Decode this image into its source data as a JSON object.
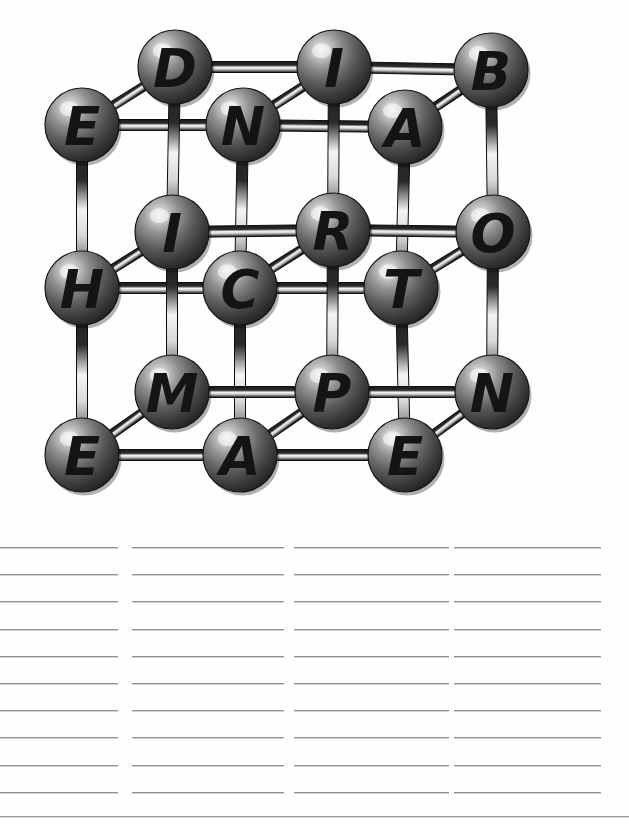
{
  "page": {
    "background_color": "#ffffff",
    "width": 629,
    "height": 824
  },
  "diagram": {
    "type": "3d-cubic-lattice-ball-and-stick",
    "sphere_color": "#6a6a6a",
    "sphere_dark_color": "#2a2a2a",
    "sphere_highlight_color": "#e8e8e8",
    "letter_color": "#141414",
    "bond_color": "#1b1b1b",
    "bond_highlight_color": "#f2f2f2",
    "grid": {
      "columns": 3,
      "rows": 3,
      "layers": 2
    },
    "letters_reading_order": [
      "E",
      "D",
      "N",
      "I",
      "A",
      "B",
      "H",
      "I",
      "C",
      "R",
      "T",
      "O",
      "E",
      "M",
      "A",
      "P",
      "E",
      "N"
    ],
    "nodes": [
      {
        "id": "n-e-1",
        "label": "E",
        "cx": 82,
        "cy": 125,
        "r": 37,
        "layer": "front",
        "row": 0,
        "col": 0
      },
      {
        "id": "n-d",
        "label": "D",
        "cx": 175,
        "cy": 67,
        "r": 37,
        "layer": "back",
        "row": 0,
        "col": 0
      },
      {
        "id": "n-n-1",
        "label": "N",
        "cx": 243,
        "cy": 125,
        "r": 37,
        "layer": "front",
        "row": 0,
        "col": 1
      },
      {
        "id": "n-i-1",
        "label": "I",
        "cx": 334,
        "cy": 67,
        "r": 37,
        "layer": "back",
        "row": 0,
        "col": 1
      },
      {
        "id": "n-a-1",
        "label": "A",
        "cx": 405,
        "cy": 127,
        "r": 37,
        "layer": "front",
        "row": 0,
        "col": 2
      },
      {
        "id": "n-b",
        "label": "B",
        "cx": 491,
        "cy": 70,
        "r": 37,
        "layer": "back",
        "row": 0,
        "col": 2
      },
      {
        "id": "n-h",
        "label": "H",
        "cx": 82,
        "cy": 288,
        "r": 37,
        "layer": "front",
        "row": 1,
        "col": 0
      },
      {
        "id": "n-i-2",
        "label": "I",
        "cx": 172,
        "cy": 232,
        "r": 37,
        "layer": "back",
        "row": 1,
        "col": 0
      },
      {
        "id": "n-c",
        "label": "C",
        "cx": 240,
        "cy": 288,
        "r": 37,
        "layer": "front",
        "row": 1,
        "col": 1
      },
      {
        "id": "n-r",
        "label": "R",
        "cx": 333,
        "cy": 230,
        "r": 37,
        "layer": "back",
        "row": 1,
        "col": 1
      },
      {
        "id": "n-t",
        "label": "T",
        "cx": 401,
        "cy": 288,
        "r": 37,
        "layer": "front",
        "row": 1,
        "col": 2
      },
      {
        "id": "n-o",
        "label": "O",
        "cx": 493,
        "cy": 232,
        "r": 37,
        "layer": "back",
        "row": 1,
        "col": 2
      },
      {
        "id": "n-e-2",
        "label": "E",
        "cx": 82,
        "cy": 455,
        "r": 37,
        "layer": "front",
        "row": 2,
        "col": 0
      },
      {
        "id": "n-m",
        "label": "M",
        "cx": 172,
        "cy": 392,
        "r": 37,
        "layer": "back",
        "row": 2,
        "col": 0
      },
      {
        "id": "n-a-2",
        "label": "A",
        "cx": 240,
        "cy": 455,
        "r": 37,
        "layer": "front",
        "row": 2,
        "col": 1
      },
      {
        "id": "n-p",
        "label": "P",
        "cx": 332,
        "cy": 392,
        "r": 37,
        "layer": "back",
        "row": 2,
        "col": 1
      },
      {
        "id": "n-e-3",
        "label": "E",
        "cx": 405,
        "cy": 455,
        "r": 37,
        "layer": "front",
        "row": 2,
        "col": 2
      },
      {
        "id": "n-n-2",
        "label": "N",
        "cx": 492,
        "cy": 392,
        "r": 37,
        "layer": "back",
        "row": 2,
        "col": 2
      }
    ],
    "bonds": [
      {
        "from": "n-e-1",
        "to": "n-d",
        "kind": "diagonal"
      },
      {
        "from": "n-e-1",
        "to": "n-n-1",
        "kind": "horizontal"
      },
      {
        "from": "n-e-1",
        "to": "n-h",
        "kind": "vertical"
      },
      {
        "from": "n-d",
        "to": "n-i-1",
        "kind": "horizontal"
      },
      {
        "from": "n-d",
        "to": "n-i-2",
        "kind": "vertical"
      },
      {
        "from": "n-n-1",
        "to": "n-i-1",
        "kind": "diagonal"
      },
      {
        "from": "n-n-1",
        "to": "n-a-1",
        "kind": "horizontal"
      },
      {
        "from": "n-n-1",
        "to": "n-c",
        "kind": "vertical"
      },
      {
        "from": "n-i-1",
        "to": "n-b",
        "kind": "horizontal"
      },
      {
        "from": "n-i-1",
        "to": "n-r",
        "kind": "vertical"
      },
      {
        "from": "n-a-1",
        "to": "n-b",
        "kind": "diagonal"
      },
      {
        "from": "n-a-1",
        "to": "n-t",
        "kind": "vertical"
      },
      {
        "from": "n-b",
        "to": "n-o",
        "kind": "vertical"
      },
      {
        "from": "n-h",
        "to": "n-i-2",
        "kind": "diagonal"
      },
      {
        "from": "n-h",
        "to": "n-c",
        "kind": "horizontal"
      },
      {
        "from": "n-h",
        "to": "n-e-2",
        "kind": "vertical"
      },
      {
        "from": "n-i-2",
        "to": "n-r",
        "kind": "horizontal"
      },
      {
        "from": "n-i-2",
        "to": "n-m",
        "kind": "vertical"
      },
      {
        "from": "n-c",
        "to": "n-r",
        "kind": "diagonal"
      },
      {
        "from": "n-c",
        "to": "n-t",
        "kind": "horizontal"
      },
      {
        "from": "n-c",
        "to": "n-a-2",
        "kind": "vertical"
      },
      {
        "from": "n-r",
        "to": "n-o",
        "kind": "horizontal"
      },
      {
        "from": "n-r",
        "to": "n-p",
        "kind": "vertical"
      },
      {
        "from": "n-t",
        "to": "n-o",
        "kind": "diagonal"
      },
      {
        "from": "n-t",
        "to": "n-e-3",
        "kind": "vertical"
      },
      {
        "from": "n-o",
        "to": "n-n-2",
        "kind": "vertical"
      },
      {
        "from": "n-e-2",
        "to": "n-m",
        "kind": "diagonal"
      },
      {
        "from": "n-e-2",
        "to": "n-a-2",
        "kind": "horizontal"
      },
      {
        "from": "n-m",
        "to": "n-p",
        "kind": "horizontal"
      },
      {
        "from": "n-a-2",
        "to": "n-p",
        "kind": "diagonal"
      },
      {
        "from": "n-a-2",
        "to": "n-e-3",
        "kind": "horizontal"
      },
      {
        "from": "n-p",
        "to": "n-n-2",
        "kind": "horizontal"
      },
      {
        "from": "n-e-3",
        "to": "n-n-2",
        "kind": "diagonal"
      }
    ]
  },
  "answer_area": {
    "line_color": "#8e9196",
    "columns": [
      {
        "id": "col-1",
        "left": 0,
        "width": 118,
        "lines": 10
      },
      {
        "id": "col-2",
        "left": 132,
        "width": 152,
        "lines": 10
      },
      {
        "id": "col-3",
        "left": 294,
        "width": 155,
        "lines": 10
      },
      {
        "id": "col-4",
        "left": 454,
        "width": 147,
        "lines": 10
      }
    ],
    "line_top_start": 27,
    "line_spacing": 27.2,
    "bottom_rule": {
      "top": 296,
      "width": 629
    }
  }
}
